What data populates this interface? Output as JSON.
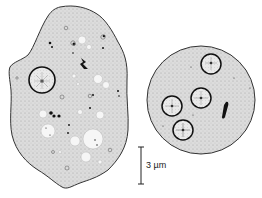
{
  "figure": {
    "scale_bar": {
      "label": "3 µm",
      "value": 3,
      "unit": "µm"
    },
    "cells": [
      {
        "name": "trophozoite",
        "nuclei": 1
      },
      {
        "name": "cyst",
        "nuclei": 4,
        "chromatoid_bodies": 1
      }
    ],
    "colors": {
      "cytoplasm": "#d9d9d9",
      "outline": "#333333",
      "vacuole": "#f4f4f4",
      "ink": "#111111"
    }
  }
}
